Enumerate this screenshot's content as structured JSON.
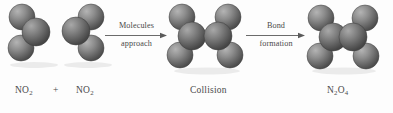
{
  "diagram": {
    "type": "chemical-reaction-space-filling",
    "caption_sequence": [
      "NO2",
      "+",
      "NO2",
      "Molecules approach",
      "Collision",
      "Bond formation",
      "N2O4"
    ],
    "background_color": "#fdfdfd",
    "sphere_color_light": "#9a9a9a",
    "sphere_color_dark": "#4f4f4f",
    "text_color": "#4a4a4a"
  },
  "labels": {
    "reactant_one": {
      "formula": "NO",
      "sub": "2"
    },
    "plus": "+",
    "reactant_two": {
      "formula": "NO",
      "sub": "2"
    },
    "collision": "Collision",
    "product": {
      "part1": "N",
      "sub1": "2",
      "part2": "O",
      "sub2": "4"
    }
  },
  "arrows": [
    {
      "name": "molecules-approach",
      "top_text": "Molecules",
      "bottom_text": "approach"
    },
    {
      "name": "bond-formation",
      "top_text": "Bond",
      "bottom_text": "formation"
    }
  ],
  "molecules": [
    {
      "name": "no2-reactant-one",
      "atoms": [
        {
          "element": "O",
          "cx": 18,
          "cy": 14,
          "r": 13
        },
        {
          "element": "N",
          "cx": 32,
          "cy": 29,
          "r": 14
        },
        {
          "element": "O",
          "cx": 17,
          "cy": 45,
          "r": 13
        }
      ]
    },
    {
      "name": "no2-reactant-two",
      "atoms": [
        {
          "element": "O",
          "cx": 33,
          "cy": 14,
          "r": 13
        },
        {
          "element": "N",
          "cx": 18,
          "cy": 28,
          "r": 14
        },
        {
          "element": "O",
          "cx": 33,
          "cy": 45,
          "r": 13
        }
      ]
    },
    {
      "name": "collision-complex",
      "atoms": [
        {
          "element": "O",
          "cx": 16,
          "cy": 14,
          "r": 13
        },
        {
          "element": "N",
          "cx": 26,
          "cy": 33,
          "r": 14
        },
        {
          "element": "O",
          "cx": 14,
          "cy": 52,
          "r": 13
        },
        {
          "element": "O",
          "cx": 62,
          "cy": 14,
          "r": 13
        },
        {
          "element": "N",
          "cx": 52,
          "cy": 33,
          "r": 14
        },
        {
          "element": "O",
          "cx": 64,
          "cy": 52,
          "r": 13
        }
      ]
    },
    {
      "name": "n2o4-product",
      "atoms": [
        {
          "element": "O",
          "cx": 16,
          "cy": 15,
          "r": 13
        },
        {
          "element": "N",
          "cx": 28,
          "cy": 34,
          "r": 14
        },
        {
          "element": "O",
          "cx": 15,
          "cy": 53,
          "r": 13
        },
        {
          "element": "O",
          "cx": 60,
          "cy": 15,
          "r": 13
        },
        {
          "element": "N",
          "cx": 48,
          "cy": 34,
          "r": 14
        },
        {
          "element": "O",
          "cx": 61,
          "cy": 53,
          "r": 13
        }
      ]
    }
  ]
}
